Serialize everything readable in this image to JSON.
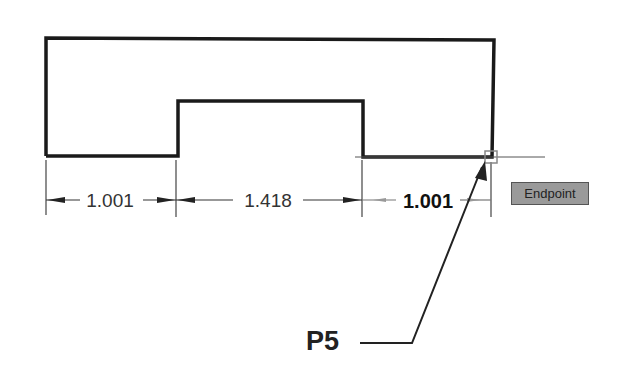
{
  "dimensions": [
    {
      "value": "1.001"
    },
    {
      "value": "1.418"
    },
    {
      "value": "1.001"
    }
  ],
  "snap_tooltip": {
    "label": "Endpoint"
  },
  "callout": {
    "label": "P5"
  },
  "colors": {
    "outline": "#1a1a1a",
    "dim_line": "#333333",
    "tooltip_bg": "#9a9a9a",
    "snap_marker": "#888888"
  }
}
